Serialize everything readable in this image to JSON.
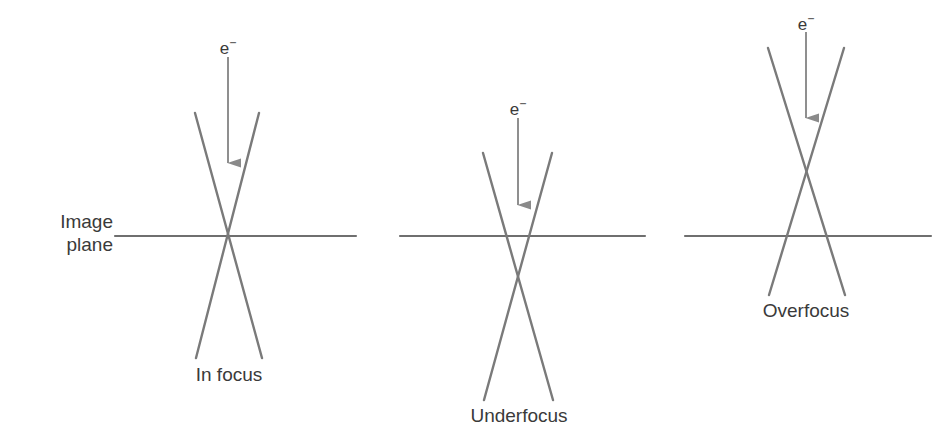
{
  "figure": {
    "background_color": "#ffffff",
    "line_color": "#6f6f6f",
    "text_color": "#3a3a3a",
    "width": 949,
    "height": 444
  },
  "axis_label": {
    "line1": "Image",
    "line2": "plane"
  },
  "panels": [
    {
      "id": "in-focus",
      "caption": "In focus",
      "beam_label_base": "e",
      "beam_label_sup": "−",
      "image_plane": {
        "x1": 115,
        "x2": 356,
        "y": 236
      },
      "crossover": {
        "x": 228,
        "y": 236
      },
      "beam_left": {
        "x1": 195,
        "y1": 113,
        "x2": 262,
        "y2": 358
      },
      "beam_right": {
        "x1": 259,
        "y1": 113,
        "x2": 196,
        "y2": 358
      },
      "arrow": {
        "x": 228,
        "y_top": 57,
        "y_tip": 163
      },
      "e_label": {
        "x": 228,
        "y": 32
      },
      "caption_pos": {
        "x": 229,
        "y": 363
      }
    },
    {
      "id": "underfocus",
      "caption": "Underfocus",
      "beam_label_base": "e",
      "beam_label_sup": "−",
      "image_plane": {
        "x1": 400,
        "x2": 645,
        "y": 236
      },
      "crossover": {
        "x": 518,
        "y": 264
      },
      "beam_left": {
        "x1": 483,
        "y1": 153,
        "x2": 553,
        "y2": 400
      },
      "beam_right": {
        "x1": 552,
        "y1": 153,
        "x2": 484,
        "y2": 400
      },
      "arrow": {
        "x": 518,
        "y_top": 118,
        "y_tip": 205
      },
      "e_label": {
        "x": 518,
        "y": 93
      },
      "caption_pos": {
        "x": 519,
        "y": 404
      }
    },
    {
      "id": "overfocus",
      "caption": "Overfocus",
      "beam_label_base": "e",
      "beam_label_sup": "−",
      "image_plane": {
        "x1": 685,
        "x2": 931,
        "y": 236
      },
      "crossover": {
        "x": 806,
        "y": 177
      },
      "beam_left": {
        "x1": 768,
        "y1": 48,
        "x2": 845,
        "y2": 295
      },
      "beam_right": {
        "x1": 844,
        "y1": 48,
        "x2": 769,
        "y2": 295
      },
      "arrow": {
        "x": 806,
        "y_top": 32,
        "y_tip": 118
      },
      "e_label": {
        "x": 806,
        "y": 8
      },
      "caption_pos": {
        "x": 806,
        "y": 299
      }
    }
  ]
}
